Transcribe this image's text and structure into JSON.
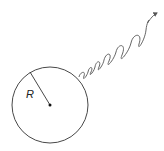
{
  "diagram": {
    "labels": {
      "radius": "R"
    },
    "colors": {
      "stroke": "#333333",
      "wave": "#555555",
      "background": "#ffffff"
    },
    "sphere": {
      "cx": 50,
      "cy": 105,
      "r": 38
    },
    "wave": {
      "start": [
        79,
        77
      ],
      "end": [
        157,
        13
      ],
      "wavelength": "increasing"
    }
  }
}
